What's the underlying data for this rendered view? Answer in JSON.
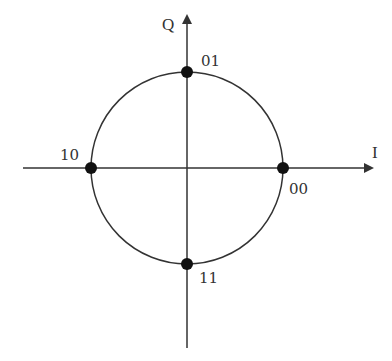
{
  "diagram": {
    "axes": {
      "horizontal_label": "I",
      "vertical_label": "Q"
    },
    "points": [
      {
        "label": "00",
        "position": "right",
        "angle_deg": 0
      },
      {
        "label": "01",
        "position": "top",
        "angle_deg": 90
      },
      {
        "label": "10",
        "position": "left",
        "angle_deg": 180
      },
      {
        "label": "11",
        "position": "bottom",
        "angle_deg": 270
      }
    ],
    "colors": {
      "line": "#333333",
      "point": "#111111",
      "background": "#ffffff"
    }
  }
}
